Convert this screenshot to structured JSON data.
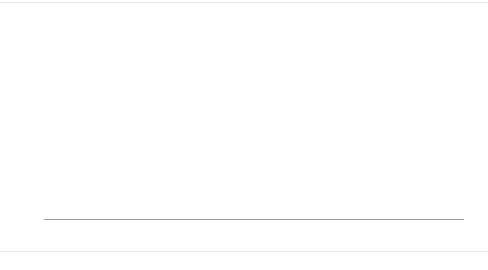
{
  "chart_data": {
    "type": "line",
    "title": "",
    "xlabel": "",
    "ylabel": "",
    "ylim": [
      0.0,
      120.0
    ],
    "yticks": [
      "0.0",
      "20.0",
      "40.0",
      "60.0",
      "80.0",
      "100.0",
      "120.0"
    ],
    "grid": false,
    "legend": "none",
    "x": [
      "1994",
      "1995",
      "1996",
      "1997",
      "1998",
      "1999",
      "2000",
      "2001",
      "2002",
      "2003",
      "2004",
      "2005",
      "2006",
      "2007",
      "2008",
      "2009",
      "2010",
      "2011",
      "2012",
      "2013",
      "2014",
      "2015",
      "2016",
      "2017"
    ],
    "series": [
      {
        "name": "중소기업(사)",
        "style": "solid-marker",
        "color": "#1a1a1a",
        "values": [
          99.3,
          99.3,
          99.3,
          99.3,
          99.4,
          99.4,
          99.5,
          99.5,
          99.6,
          99.6,
          99.6,
          99.7,
          99.7,
          99.8,
          99.8,
          99.8,
          99.8,
          99.8,
          99.9,
          99.9,
          99.9,
          99.9,
          99.9,
          99.9
        ]
      },
      {
        "name": "소기업(사)",
        "style": "solid-thin",
        "color": "#2b2b2b",
        "values": [
          94.4,
          97.6,
          97.6,
          97.6,
          97.7,
          97.8,
          97.9,
          98.0,
          98.1,
          98.2,
          98.3,
          98.4,
          98.5,
          98.6,
          98.7,
          98.8,
          98.9,
          99.0,
          99.1,
          99.2,
          99.3,
          99.4,
          99.5,
          99.6
        ]
      },
      {
        "name": "소상공인(사)",
        "style": "dotted-marker",
        "color": "#1a1a1a",
        "values": [
          90.3,
          90.1,
          89.8,
          89.4,
          89.3,
          89.1,
          88.8,
          88.4,
          88.1,
          87.9,
          87.8,
          87.8,
          87.6,
          87.4,
          87.2,
          87.1,
          87.0,
          86.8,
          86.6,
          86.4,
          87.9,
          86.2,
          85.8,
          85.3
        ]
      },
      {
        "name": "중소기업(종)",
        "style": "solid-thin",
        "color": "#555555",
        "values": [
          75.1,
          75.2,
          75.4,
          75.6,
          76.0,
          77.2,
          78.8,
          80.4,
          81.8,
          82.8,
          83.4,
          84.0,
          85.4,
          86.4,
          86.8,
          87.2,
          87.4,
          87.6,
          87.7,
          87.8,
          87.9,
          88.9,
          89.4,
          89.8
        ]
      },
      {
        "name": "소기업(종)",
        "style": "dotted-thin",
        "color": "#6a6a6a",
        "values": [
          41.0,
          56.7,
          47.5,
          46.0,
          44.8,
          45.5,
          48.6,
          52.3,
          54.0,
          55.2,
          55.6,
          56.0,
          56.6,
          57.0,
          57.2,
          57.3,
          57.4,
          57.4,
          57.0,
          66.6,
          66.4,
          66.2,
          66.0,
          65.9
        ]
      },
      {
        "name": "소상공인(종)",
        "style": "dashed-thin",
        "color": "#8a8a8a",
        "values": [
          39.9,
          39.8,
          39.6,
          39.3,
          39.0,
          38.7,
          38.5,
          38.3,
          38.1,
          38.0,
          37.9,
          37.8,
          37.6,
          37.5,
          37.4,
          37.3,
          37.2,
          37.1,
          37.0,
          36.9,
          36.9,
          36.8,
          36.8,
          36.8
        ]
      },
      {
        "name": "대기업(종)",
        "style": "solid-thick",
        "color": "#1f1f1f",
        "values": [
          24.9,
          24.8,
          24.6,
          23.6,
          22.2,
          20.5,
          18.7,
          17.0,
          16.1,
          15.8,
          15.5,
          15.2,
          15.3,
          15.6,
          15.7,
          15.8,
          15.9,
          16.0,
          15.7,
          15.3,
          14.8,
          13.0,
          11.1,
          10.2
        ]
      },
      {
        "name": "중기업(종)",
        "style": "solid-marker",
        "color": "#3a3a3a",
        "values": [
          15.8,
          15.8,
          16.2,
          16.5,
          16.8,
          17.0,
          17.4,
          21.0,
          23.6,
          24.0,
          24.2,
          24.8,
          25.6,
          27.2,
          27.7,
          28.2,
          28.8,
          29.8,
          28.7,
          23.2,
          23.0,
          23.6,
          23.7,
          23.8
        ]
      },
      {
        "name": "중기업(사)",
        "style": "dotted-flat",
        "color": "#9a9a9a",
        "values": [
          5.3,
          1.6,
          1.6,
          1.6,
          1.6,
          1.6,
          1.6,
          1.7,
          1.7,
          1.8,
          1.8,
          1.9,
          2.0,
          2.1,
          2.2,
          2.3,
          2.4,
          2.5,
          2.6,
          2.7,
          2.8,
          2.9,
          3.0,
          3.0
        ]
      }
    ],
    "annotations": [
      {
        "id": "ann-jungso-sa-start",
        "text": "중소기업(사),1994, 99.3"
      },
      {
        "id": "ann-so-sa-start",
        "text": "소기업(사),1995, 97.6"
      },
      {
        "id": "ann-sosang-sa-start",
        "text": "소상공인(사),1994, 90.3"
      },
      {
        "id": "ann-jungso-jong-start",
        "text": "중소기업(종),1994, 75.1"
      },
      {
        "id": "ann-so-jong-start",
        "text": "소기업(종),1995, 56.7"
      },
      {
        "id": "ann-so-jong-1999",
        "text": "1999, 45.5"
      },
      {
        "id": "ann-sosang-jong-start",
        "text": "소상공인(종),1994, 39.9"
      },
      {
        "id": "ann-dae-jong-start",
        "text": "대기업(종),1994, 24.9"
      },
      {
        "id": "ann-jung-jong-start",
        "text": "중기업(종),1995,15.8"
      },
      {
        "id": "ann-jung-sa-start",
        "text": "중기업(사),1994, 5.3"
      },
      {
        "id": "ann-jung-sa-value",
        "text": "1.6"
      },
      {
        "id": "ann-sosang-sa-2005",
        "text": "2005, 87.8"
      },
      {
        "id": "ann-so-jong-2011",
        "text": "2011, 57.4"
      },
      {
        "id": "ann-jungso-jong-2014",
        "text": "2014, 87.9"
      },
      {
        "id": "ann-so-sa-2015",
        "text": "2015, 90.2"
      },
      {
        "id": "ann-jung-jong-2011-val",
        "text": "29.8"
      },
      {
        "id": "ann-end-999",
        "text": "99.9"
      },
      {
        "id": "ann-end-963",
        "text": "96.3"
      },
      {
        "id": "ann-end-898",
        "text": "89.8"
      },
      {
        "id": "ann-end-853",
        "text": "85.3"
      },
      {
        "id": "ann-end-659",
        "text": "65.9"
      },
      {
        "id": "ann-end-368",
        "text": "36.8"
      },
      {
        "id": "ann-end-238",
        "text": "23.8"
      },
      {
        "id": "ann-end-102",
        "text": "10.2"
      },
      {
        "id": "ann-end-30",
        "text": "3.0"
      }
    ]
  }
}
